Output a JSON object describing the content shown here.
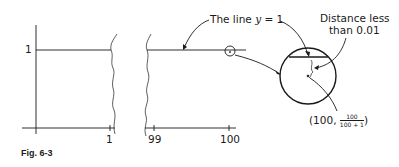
{
  "figure": {
    "caption": "Fig. 6-3",
    "y_axis": {
      "tick_label": "1"
    },
    "x_axis": {
      "ticks": [
        {
          "label": "1"
        },
        {
          "label": "99"
        },
        {
          "label": "100"
        }
      ]
    },
    "annotations": {
      "line_label_prefix": "The line ",
      "line_label_var": "y",
      "line_label_suffix": " = 1",
      "distance_line1": "Distance less",
      "distance_line2": "than 0.01",
      "point_prefix": "(100, ",
      "point_num": "100",
      "point_den": "100 + 1",
      "point_suffix": ")"
    },
    "colors": {
      "ink": "#1a1a1a",
      "background": "#ffffff"
    }
  }
}
